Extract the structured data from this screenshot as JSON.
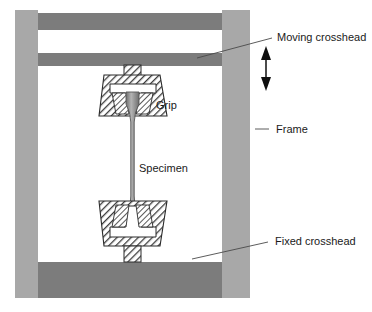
{
  "diagram": {
    "background_color": "#ffffff",
    "colors": {
      "frame_column": "#a8a8a8",
      "crosshead": "#7c7c7c",
      "hatch_line": "#3c3c3c",
      "hatch_field": "#ffffff",
      "specimen": "#8e8e8e",
      "specimen_edge": "#555555",
      "label_text": "#1a1a1a",
      "leader_line": "#4a4a4a",
      "arrow": "#0f0f0f",
      "cavity": "#ffffff",
      "outline": "#2a2a2a"
    },
    "labels": {
      "moving_crosshead": "Moving crosshead",
      "frame": "Frame",
      "fixed_crosshead": "Fixed crosshead",
      "grip": "Grip",
      "specimen": "Specimen"
    },
    "annotations": {
      "motion_arrow": "double-headed vertical arrow indicating crosshead travel"
    },
    "parts": [
      {
        "name": "frame-column-left",
        "kind": "frame"
      },
      {
        "name": "frame-column-right",
        "kind": "frame"
      },
      {
        "name": "top-beam",
        "kind": "crosshead"
      },
      {
        "name": "moving-crosshead-beam",
        "kind": "crosshead"
      },
      {
        "name": "fixed-crosshead-base",
        "kind": "crosshead"
      },
      {
        "name": "upper-grip",
        "kind": "grip"
      },
      {
        "name": "lower-grip",
        "kind": "grip"
      },
      {
        "name": "specimen",
        "kind": "specimen"
      }
    ]
  }
}
